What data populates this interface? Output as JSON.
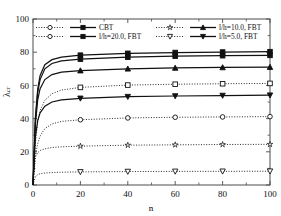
{
  "chart_data": {
    "type": "line",
    "title": "",
    "xlabel": "n",
    "ylabel": "λ",
    "ylabel_sub": "cr",
    "xlim": [
      0,
      100
    ],
    "ylim": [
      0,
      100
    ],
    "xticks": [
      0,
      20,
      40,
      60,
      80,
      100
    ],
    "yticks": [
      0,
      20,
      40,
      60,
      80,
      100
    ],
    "grid": false,
    "legend_position": "top-inside",
    "legend": [
      {
        "label": "CBT",
        "open_marker": "circle",
        "filled_marker": "square"
      },
      {
        "label": "l/h=10.0, FBT",
        "open_marker": "star",
        "filled_marker": "triangle-up"
      },
      {
        "label": "l/h=20.0, FBT",
        "open_marker": "circle",
        "filled_marker": "square"
      },
      {
        "label": "l/h=5.0, FBT",
        "open_marker": "triangle-down",
        "filled_marker": "triangle-down"
      }
    ],
    "x": [
      0,
      1,
      2,
      3,
      5,
      8,
      12,
      20,
      40,
      60,
      80,
      100
    ],
    "marker_x": [
      0,
      20,
      40,
      60,
      80,
      100
    ],
    "series": [
      {
        "name": "CBT solid (squares)",
        "style": "solid",
        "marker": "square-filled",
        "values": [
          0,
          40.5,
          58.0,
          66.0,
          72.5,
          75.5,
          77.0,
          78.2,
          79.3,
          79.8,
          80.1,
          80.3
        ]
      },
      {
        "name": "l/h=20.0 FBT solid (squares)",
        "style": "solid",
        "marker": "square-filled",
        "values": [
          0,
          39.0,
          56.0,
          63.5,
          70.0,
          73.2,
          74.8,
          75.8,
          77.0,
          77.6,
          77.9,
          78.1
        ]
      },
      {
        "name": "l/h=10.0 FBT solid (triangles)",
        "style": "solid",
        "marker": "triangle-up-filled",
        "values": [
          0,
          36.5,
          51.5,
          58.0,
          63.5,
          66.5,
          68.0,
          68.9,
          70.0,
          70.5,
          70.8,
          71.0
        ]
      },
      {
        "name": "l/h=5.0 FBT solid (down triangles)",
        "style": "solid",
        "marker": "triangle-down-filled",
        "values": [
          0,
          29.0,
          39.0,
          43.5,
          47.5,
          50.0,
          51.3,
          52.2,
          53.2,
          53.6,
          53.9,
          54.1
        ]
      },
      {
        "name": "CBT dotted (open squares)",
        "style": "dotted",
        "marker": "square-open",
        "values": [
          0,
          25.0,
          38.0,
          45.0,
          51.0,
          55.0,
          57.2,
          58.8,
          60.2,
          60.7,
          61.0,
          61.2
        ]
      },
      {
        "name": "l/h=20.0 dotted (open circles)",
        "style": "dotted",
        "marker": "circle-open",
        "values": [
          0,
          17.5,
          25.0,
          29.5,
          34.0,
          36.8,
          38.3,
          39.3,
          40.4,
          40.8,
          41.0,
          41.2
        ]
      },
      {
        "name": "l/h=10.0 dotted (open stars)",
        "style": "dotted",
        "marker": "star-open",
        "values": [
          0,
          16.8,
          19.5,
          20.8,
          21.8,
          22.6,
          23.0,
          23.4,
          24.0,
          24.2,
          24.4,
          24.5
        ]
      },
      {
        "name": "l/h=5.0 dotted (open down triangles)",
        "style": "dotted",
        "marker": "triangle-down-open",
        "values": [
          0,
          5.0,
          6.2,
          6.8,
          7.2,
          7.5,
          7.7,
          7.9,
          8.1,
          8.2,
          8.25,
          8.3
        ]
      }
    ]
  },
  "axes": {
    "x_label": "n",
    "y_label_main": "λ",
    "y_label_sub": "cr",
    "x_ticks": [
      "0",
      "20",
      "40",
      "60",
      "80",
      "100"
    ],
    "y_ticks": [
      "0",
      "20",
      "40",
      "60",
      "80",
      "100"
    ]
  },
  "legend": {
    "entry1": "CBT",
    "entry2": "l/h=10.0, FBT",
    "entry3": "l/h=20.0, FBT",
    "entry4": "l/h=5.0, FBT"
  },
  "colors": {
    "line": "#1a1a1a",
    "axis": "#4d4d4d",
    "background": "#ffffff"
  }
}
